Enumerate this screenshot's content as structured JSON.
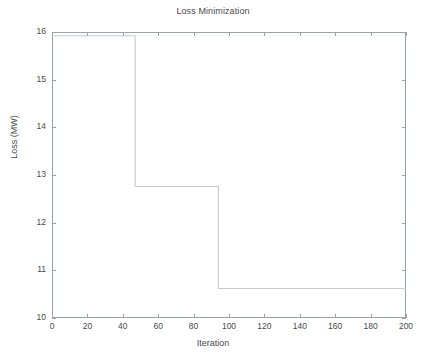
{
  "figure": {
    "title": "Loss Minimization",
    "background_color": "#ffffff",
    "axis_color": "#9aa3ad",
    "line_color": "#c8ccd0",
    "text_color": "#4a4a4a"
  },
  "axes": {
    "x_axis_label": "Iteration",
    "y_axis_label": "Loss (MW)",
    "x_ticks": [
      "0",
      "20",
      "40",
      "60",
      "80",
      "100",
      "120",
      "140",
      "160",
      "180",
      "200"
    ],
    "y_ticks": [
      "10",
      "11",
      "12",
      "13",
      "14",
      "15",
      "16"
    ]
  },
  "chart_data": {
    "type": "line",
    "title": "Loss Minimization",
    "xlabel": "Iteration",
    "ylabel": "Loss (MW)",
    "xlim": [
      0,
      200
    ],
    "ylim": [
      10,
      16
    ],
    "xticks": [
      0,
      20,
      40,
      60,
      80,
      100,
      120,
      140,
      160,
      180,
      200
    ],
    "yticks": [
      10,
      11,
      12,
      13,
      14,
      15,
      16
    ],
    "grid": false,
    "legend": false,
    "series": [
      {
        "name": "Loss",
        "drawstyle": "steps-post",
        "x": [
          1,
          47,
          47,
          94,
          94,
          200
        ],
        "y": [
          15.92,
          15.92,
          12.76,
          12.76,
          10.62,
          10.62
        ]
      }
    ],
    "annotations": [
      {
        "text": "initial loss plateau",
        "value": 15.92,
        "x_range": [
          1,
          47
        ]
      },
      {
        "text": "first improvement",
        "value": 12.76,
        "x_range": [
          47,
          94
        ]
      },
      {
        "text": "final converged loss",
        "value": 10.62,
        "x_range": [
          94,
          200
        ]
      }
    ]
  }
}
